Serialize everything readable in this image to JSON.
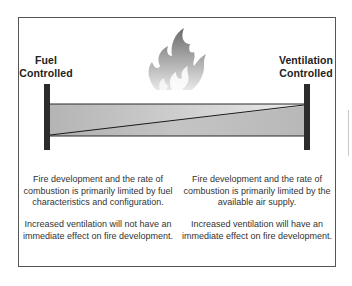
{
  "diagram": {
    "left_label": "Fuel\nControlled",
    "left_label_line1": "Fuel",
    "left_label_line2": "Controlled",
    "right_label_line1": "Ventilation",
    "right_label_line2": "Controlled",
    "left_description": "Fire development and the rate of combustion is primarily limited by fuel characteristics and configuration.",
    "left_effect": "Increased ventilation will not have an immediate effect on fire development.",
    "right_description": "Fire development and the rate of combustion is primarily limited by the available air supply.",
    "right_effect": "Increased ventilation will have an immediate effect on fire development.",
    "icons": [
      "flame-icon"
    ],
    "colors": {
      "frame": "#555555",
      "pillar": "#2c2c2c",
      "bar_fill": "#b8b8b8",
      "bar_light": "#e0e0e0",
      "flame_dark": "#6e6e6e",
      "flame_light": "#e6e6e6"
    }
  }
}
